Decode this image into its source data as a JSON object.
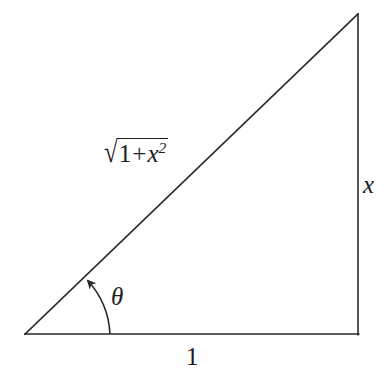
{
  "figure": {
    "background_color": "#ffffff",
    "stroke_color": "#2a2a2a",
    "text_color": "#1c1c1c",
    "stroke_width": 1.6,
    "width": 384,
    "height": 377
  },
  "labels": {
    "hypotenuse": {
      "text": "√(1 + x²)",
      "radical_sign": "√",
      "radicand_first": "1",
      "radicand_operator": "+",
      "radicand_variable": "x",
      "radicand_exponent": "2"
    },
    "vertical_side": "x",
    "base_side": "1",
    "angle": "θ"
  },
  "geometry": {
    "vertices": {
      "left": [
        25,
        334
      ],
      "bottom_right": [
        358,
        334
      ],
      "top_right": [
        358,
        14
      ]
    },
    "sides": [
      {
        "name": "base",
        "from": [
          25,
          334
        ],
        "to": [
          358,
          334
        ],
        "label": "1"
      },
      {
        "name": "vertical",
        "from": [
          358,
          334
        ],
        "to": [
          358,
          14
        ],
        "label": "x"
      },
      {
        "name": "hypotenuse",
        "from": [
          25,
          334
        ],
        "to": [
          358,
          14
        ],
        "label": "√(1 + x²)"
      }
    ],
    "angle_arc": {
      "center": [
        25,
        334
      ],
      "radius": 85,
      "start_point": [
        110,
        334
      ],
      "end_point": [
        86,
        278
      ],
      "arrow_at": "end_point",
      "label": "θ"
    }
  }
}
